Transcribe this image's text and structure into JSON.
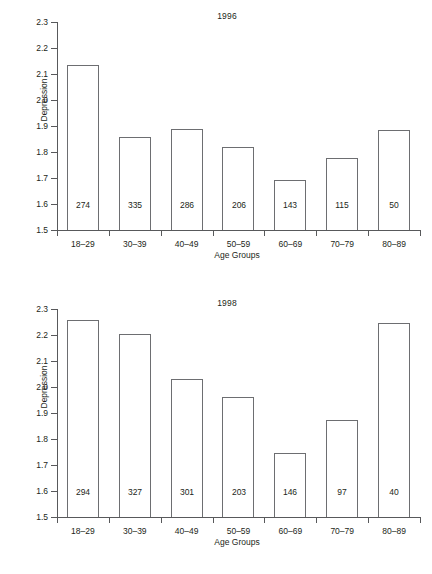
{
  "figure": {
    "shared_xlabel": "Age Groups",
    "shared_ylabel": "Depression",
    "categories": [
      "18–29",
      "30–39",
      "40–49",
      "50–59",
      "60–69",
      "70–79",
      "80–89"
    ],
    "ytick_labels": [
      "2.3",
      "2.2",
      "2.1",
      "2.0",
      "1.9",
      "1.8",
      "1.7",
      "1.6",
      "1.5"
    ],
    "ytick_values": [
      2.3,
      2.2,
      2.1,
      2.0,
      1.9,
      1.8,
      1.7,
      1.6,
      1.5
    ],
    "ylim": [
      1.5,
      2.3
    ],
    "line_color": "#6d6e71",
    "text_color": "#231f20",
    "background": "#ffffff"
  },
  "chart_data": [
    {
      "type": "bar",
      "title": "1996",
      "xlabel": "Age Groups",
      "ylabel": "Depression",
      "categories": [
        "18–29",
        "30–39",
        "40–49",
        "50–59",
        "60–69",
        "70–79",
        "80–89"
      ],
      "values": [
        2.135,
        1.857,
        1.888,
        1.82,
        1.692,
        1.777,
        1.886
      ],
      "bar_labels": [
        "274",
        "335",
        "286",
        "206",
        "143",
        "115",
        "50"
      ],
      "ylim": [
        1.5,
        2.3
      ],
      "yticks": [
        1.5,
        1.6,
        1.7,
        1.8,
        1.9,
        2.0,
        2.1,
        2.2,
        2.3
      ],
      "grid": false,
      "legend": "none"
    },
    {
      "type": "bar",
      "title": "1998",
      "xlabel": "Age Groups",
      "ylabel": "Depression",
      "categories": [
        "18–29",
        "30–39",
        "40–49",
        "50–59",
        "60–69",
        "70–79",
        "80–89"
      ],
      "values": [
        2.259,
        2.205,
        2.03,
        1.962,
        1.747,
        1.874,
        2.247
      ],
      "bar_labels": [
        "294",
        "327",
        "301",
        "203",
        "146",
        "97",
        "40"
      ],
      "ylim": [
        1.5,
        2.3
      ],
      "yticks": [
        1.5,
        1.6,
        1.7,
        1.8,
        1.9,
        2.0,
        2.1,
        2.2,
        2.3
      ],
      "grid": false,
      "legend": "none"
    }
  ]
}
